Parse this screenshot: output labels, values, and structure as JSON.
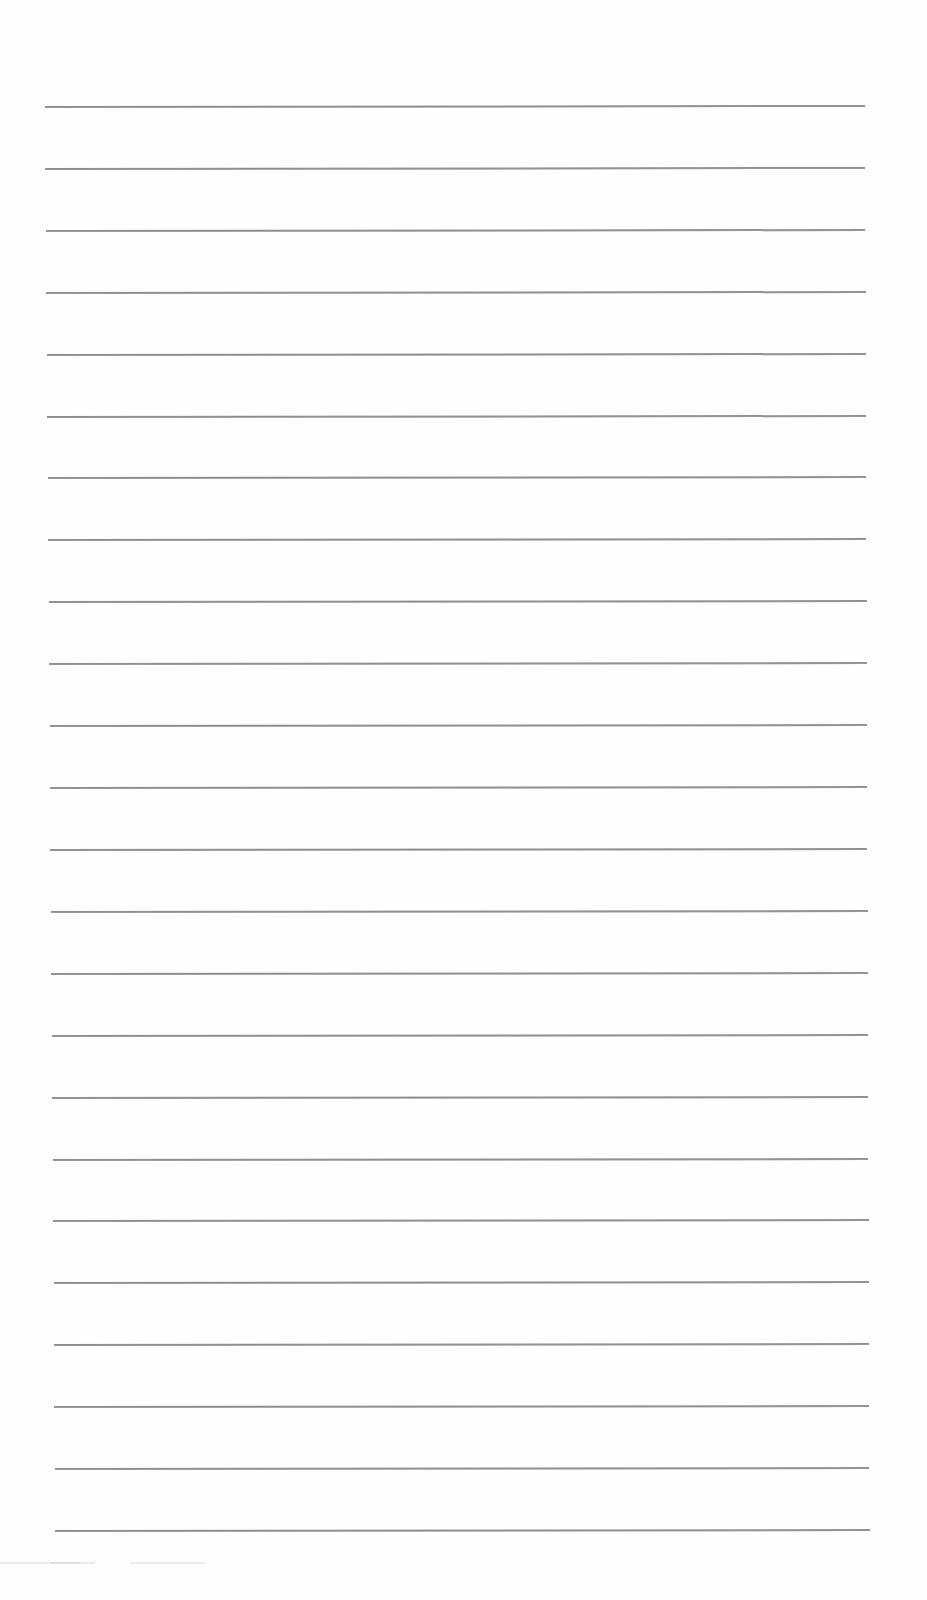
{
  "document": {
    "type": "blank ruled sheet",
    "line_color": "#8f8f8f",
    "background_color": "#fefefe",
    "line_count": 24,
    "handwritten_text": []
  }
}
